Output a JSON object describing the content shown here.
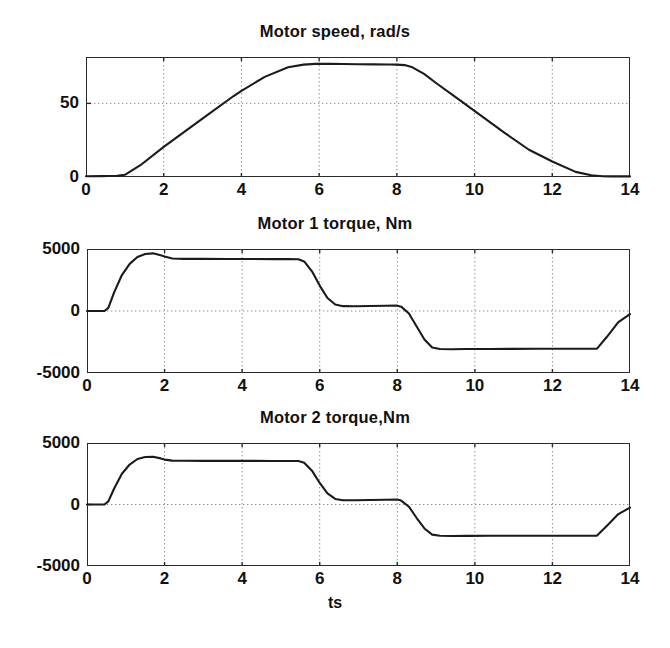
{
  "figure": {
    "background": "#ffffff",
    "line_color": "#1b1b1b",
    "grid_color": "#8d8d8d",
    "axis_color": "#2b2b2b",
    "xlabel": "ts"
  },
  "chart_data": [
    {
      "type": "line",
      "title": "Motor speed, rad/s",
      "xlabel": "",
      "ylabel": "",
      "xlim": [
        0,
        14
      ],
      "ylim": [
        0,
        81.5
      ],
      "xticks": [
        0,
        2,
        4,
        6,
        8,
        10,
        12,
        14
      ],
      "xticklabels": [
        "0",
        "2",
        "4",
        "6",
        "8",
        "10",
        "12",
        "14"
      ],
      "yticks": [
        0,
        50
      ],
      "yticklabels": [
        "0",
        "50"
      ],
      "grid": true,
      "series": [
        {
          "name": "motor speed",
          "x": [
            0.0,
            0.4,
            0.8,
            1.0,
            1.4,
            2.0,
            2.6,
            3.2,
            3.8,
            4.0,
            4.6,
            5.2,
            5.6,
            5.9,
            6.1,
            6.3,
            6.6,
            7.0,
            7.4,
            7.8,
            8.0,
            8.2,
            8.4,
            8.7,
            9.0,
            9.6,
            10.2,
            10.8,
            11.4,
            12.0,
            12.6,
            13.0,
            13.3,
            13.5,
            14.0
          ],
          "y": [
            0.5,
            0.6,
            0.8,
            1.5,
            8.0,
            20.5,
            32.0,
            43.5,
            55.0,
            58.5,
            68.0,
            74.5,
            76.3,
            76.8,
            76.9,
            76.8,
            76.7,
            76.6,
            76.5,
            76.4,
            76.3,
            76.0,
            74.5,
            70.0,
            64.0,
            52.5,
            41.0,
            29.5,
            18.5,
            10.5,
            3.5,
            1.2,
            0.5,
            0.4,
            0.4
          ]
        }
      ]
    },
    {
      "type": "line",
      "title": "Motor 1 torque, Nm",
      "xlabel": "",
      "ylabel": "",
      "xlim": [
        0,
        14
      ],
      "ylim": [
        -5000,
        5000
      ],
      "xticks": [
        0,
        2,
        4,
        6,
        8,
        10,
        12,
        14
      ],
      "xticklabels": [
        "0",
        "2",
        "4",
        "6",
        "8",
        "10",
        "12",
        "14"
      ],
      "yticks": [
        -5000,
        0,
        5000
      ],
      "yticklabels": [
        "-5000",
        "0",
        "5000"
      ],
      "grid": true,
      "series": [
        {
          "name": "motor 1 torque",
          "x": [
            0.0,
            0.2,
            0.45,
            0.55,
            0.7,
            0.9,
            1.1,
            1.3,
            1.5,
            1.7,
            1.9,
            2.0,
            2.2,
            2.5,
            3.0,
            3.6,
            4.2,
            4.8,
            5.2,
            5.45,
            5.6,
            5.8,
            6.0,
            6.2,
            6.4,
            6.6,
            6.9,
            7.3,
            7.7,
            8.0,
            8.1,
            8.3,
            8.5,
            8.7,
            8.9,
            9.1,
            9.4,
            9.8,
            10.4,
            11.0,
            11.6,
            12.2,
            12.8,
            13.0,
            13.15,
            13.4,
            13.7,
            14.0
          ],
          "y": [
            0,
            0,
            0,
            250,
            1500,
            2900,
            3800,
            4350,
            4600,
            4650,
            4500,
            4400,
            4230,
            4205,
            4200,
            4195,
            4190,
            4185,
            4180,
            4170,
            4000,
            3200,
            2050,
            1050,
            520,
            390,
            380,
            400,
            420,
            430,
            350,
            -200,
            -1250,
            -2300,
            -2950,
            -3060,
            -3080,
            -3070,
            -3060,
            -3055,
            -3050,
            -3050,
            -3045,
            -3040,
            -3035,
            -2100,
            -900,
            -250
          ]
        }
      ]
    },
    {
      "type": "line",
      "title": "Motor 2 torque,Nm",
      "xlabel": "ts",
      "ylabel": "",
      "xlim": [
        0,
        14
      ],
      "ylim": [
        -5000,
        5000
      ],
      "xticks": [
        0,
        2,
        4,
        6,
        8,
        10,
        12,
        14
      ],
      "xticklabels": [
        "0",
        "2",
        "4",
        "6",
        "8",
        "10",
        "12",
        "14"
      ],
      "yticks": [
        -5000,
        0,
        5000
      ],
      "yticklabels": [
        "-5000",
        "0",
        "5000"
      ],
      "grid": true,
      "series": [
        {
          "name": "motor 2 torque",
          "x": [
            0.0,
            0.2,
            0.45,
            0.55,
            0.7,
            0.9,
            1.1,
            1.3,
            1.5,
            1.7,
            1.9,
            2.0,
            2.2,
            2.5,
            3.0,
            3.6,
            4.2,
            4.8,
            5.2,
            5.45,
            5.6,
            5.8,
            6.0,
            6.2,
            6.4,
            6.6,
            6.9,
            7.3,
            7.7,
            8.0,
            8.1,
            8.3,
            8.5,
            8.7,
            8.9,
            9.1,
            9.4,
            9.8,
            10.4,
            11.0,
            11.6,
            12.2,
            12.8,
            13.0,
            13.15,
            13.4,
            13.7,
            14.0
          ],
          "y": [
            0,
            0,
            0,
            250,
            1300,
            2500,
            3250,
            3700,
            3860,
            3880,
            3750,
            3650,
            3570,
            3555,
            3550,
            3548,
            3545,
            3542,
            3540,
            3535,
            3400,
            2750,
            1750,
            900,
            450,
            350,
            340,
            360,
            390,
            400,
            320,
            -180,
            -1100,
            -1950,
            -2450,
            -2545,
            -2555,
            -2550,
            -2545,
            -2545,
            -2540,
            -2540,
            -2538,
            -2535,
            -2530,
            -1750,
            -780,
            -250
          ]
        }
      ]
    }
  ],
  "geometry": [
    {
      "left": 86,
      "top": 57,
      "width": 544,
      "height": 120,
      "title_top": 22,
      "ymin": 0,
      "ymax": 81.5
    },
    {
      "left": 87,
      "top": 249,
      "width": 543,
      "height": 124,
      "title_top": 214,
      "ymin": -5000,
      "ymax": 5000
    },
    {
      "left": 87,
      "top": 443,
      "width": 543,
      "height": 123,
      "title_top": 408,
      "ymin": -5000,
      "ymax": 5000
    }
  ]
}
